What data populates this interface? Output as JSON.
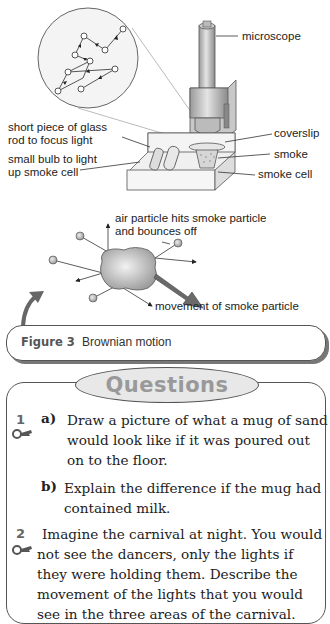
{
  "figure": {
    "labels": {
      "microscope": "microscope",
      "coverslip": "coverslip",
      "smoke": "smoke",
      "smoke_cell": "smoke cell",
      "glass_rod_line1": "short piece of glass",
      "glass_rod_line2": "rod to focus light",
      "bulb_line1": "small bulb to light",
      "bulb_line2": "up smoke cell",
      "air_particle_line1": "air particle hits smoke particle",
      "air_particle_line2": "and bounces off",
      "movement": "movement of smoke particle"
    },
    "caption": {
      "label": "Figure 3",
      "title": "Brownian motion"
    }
  },
  "questions": {
    "heading": "Questions",
    "items": [
      {
        "number": "1",
        "parts": [
          {
            "label": "a)",
            "lines": [
              "Draw a picture of what a mug of sand",
              "would look like if it was poured out",
              "on to the floor."
            ]
          },
          {
            "label": "b)",
            "lines": [
              "Explain the difference if the mug had",
              "contained milk."
            ]
          }
        ]
      },
      {
        "number": "2",
        "lines": [
          "Imagine the carnival at night. You would",
          "not see the dancers, only the lights if",
          "they were holding them. Describe the",
          "movement of the lights that you would",
          "see in the three areas of the carnival."
        ]
      }
    ]
  },
  "colors": {
    "accent_gray": "#666666",
    "oval_fill": "#e8e8e8",
    "heading_text": "#999999"
  }
}
